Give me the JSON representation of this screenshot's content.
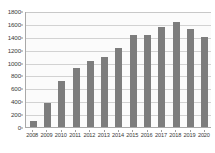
{
  "chart_data": {
    "type": "bar",
    "title": "",
    "subtitle": "",
    "xlabel": "",
    "ylabel": "",
    "categories": [
      "2008",
      "2009",
      "2010",
      "2011",
      "2012",
      "2013",
      "2014",
      "2015",
      "2016",
      "2017",
      "2018",
      "2019",
      "2020"
    ],
    "values": [
      100,
      375,
      710,
      915,
      1020,
      1080,
      1230,
      1425,
      1430,
      1550,
      1630,
      1525,
      1390
    ],
    "series": [
      {
        "name": "",
        "values": [
          100,
          375,
          710,
          915,
          1020,
          1080,
          1230,
          1425,
          1430,
          1550,
          1630,
          1525,
          1390
        ]
      }
    ],
    "ylim": [
      0,
      1800
    ],
    "yticks": [
      0,
      200,
      400,
      600,
      800,
      1000,
      1200,
      1400,
      1600,
      1800
    ],
    "ytick_labels": [
      "0",
      "200",
      "400",
      "600",
      "800",
      "1000",
      "1200",
      "1400",
      "1600",
      "1800"
    ],
    "grid": true,
    "grid_axis": "y",
    "legend": false,
    "legend_position": "none",
    "bar_color": "#7d7d7d",
    "grid_color": "#d2d2d2",
    "axis_color": "#a9a9a9",
    "plot_background": "#fbfbfb",
    "figure_background": "#ffffff",
    "text_color": "#3a3a3a"
  }
}
